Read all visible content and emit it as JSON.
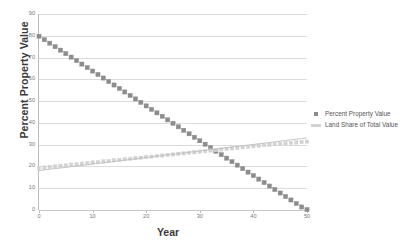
{
  "chart_data": {
    "type": "line",
    "title": "",
    "xlabel": "Year",
    "ylabel": "Percent Property Value",
    "xlim": [
      0,
      50
    ],
    "ylim": [
      0,
      90
    ],
    "xticks": [
      "0",
      "10",
      "20",
      "30",
      "40",
      "50"
    ],
    "yticks": [
      "0",
      "10",
      "20",
      "30",
      "40",
      "50",
      "60",
      "70",
      "80",
      "90"
    ],
    "grid": "horizontal",
    "legend_position": "right",
    "x": [
      0,
      1,
      2,
      3,
      4,
      5,
      6,
      7,
      8,
      9,
      10,
      11,
      12,
      13,
      14,
      15,
      16,
      17,
      18,
      19,
      20,
      21,
      22,
      23,
      24,
      25,
      26,
      27,
      28,
      29,
      30,
      31,
      32,
      33,
      34,
      35,
      36,
      37,
      38,
      39,
      40,
      41,
      42,
      43,
      44,
      45,
      46,
      47,
      48,
      49,
      50
    ],
    "series": [
      {
        "name": "Percent Property Value",
        "color": "#8c8c8c",
        "marker": "square",
        "values": [
          79.8,
          78.2,
          76.6,
          75.0,
          73.4,
          71.8,
          70.2,
          68.6,
          67.0,
          65.4,
          63.8,
          62.2,
          60.6,
          59.0,
          57.4,
          55.8,
          54.2,
          52.6,
          51.0,
          49.4,
          47.8,
          46.2,
          44.6,
          43.0,
          41.4,
          39.8,
          38.2,
          36.6,
          35.0,
          33.4,
          31.8,
          30.2,
          28.6,
          27.0,
          25.4,
          23.8,
          22.2,
          20.6,
          19.0,
          17.4,
          15.8,
          14.2,
          12.6,
          11.0,
          9.4,
          7.8,
          6.2,
          4.6,
          3.0,
          1.4,
          0.2
        ]
      },
      {
        "name": "Land Share of Total Value",
        "color": "#d2d2d2",
        "marker": "square-light",
        "values": [
          19.3,
          19.5,
          19.8,
          20.0,
          20.3,
          20.5,
          20.8,
          21.0,
          21.3,
          21.5,
          21.8,
          22.0,
          22.3,
          22.5,
          22.8,
          23.0,
          23.3,
          23.5,
          23.8,
          24.0,
          24.3,
          24.5,
          24.8,
          25.0,
          25.3,
          25.5,
          25.8,
          26.0,
          26.3,
          26.5,
          26.8,
          27.0,
          27.3,
          27.5,
          27.8,
          28.0,
          28.3,
          28.5,
          28.8,
          29.0,
          29.3,
          29.5,
          29.8,
          30.0,
          30.2,
          30.4,
          30.6,
          30.8,
          31.0,
          31.2,
          31.4
        ]
      },
      {
        "name": "Land Share trend line",
        "color": "#bfbfbf",
        "marker": "none",
        "values": [
          18.1,
          18.4,
          18.7,
          19.0,
          19.3,
          19.6,
          19.9,
          20.2,
          20.5,
          20.8,
          21.1,
          21.4,
          21.7,
          22.0,
          22.3,
          22.6,
          22.9,
          23.2,
          23.5,
          23.8,
          24.1,
          24.4,
          24.7,
          25.0,
          25.3,
          25.6,
          25.9,
          26.2,
          26.5,
          26.8,
          27.1,
          27.4,
          27.7,
          28.0,
          28.3,
          28.6,
          28.9,
          29.2,
          29.5,
          29.8,
          30.1,
          30.4,
          30.7,
          31.0,
          31.3,
          31.6,
          31.9,
          32.2,
          32.5,
          32.8,
          33.1
        ]
      }
    ],
    "legend": [
      {
        "label": "Percent Property Value",
        "marker": "square",
        "color": "#8c8c8c"
      },
      {
        "label": "Land Share of Total Value",
        "marker": "line",
        "color": "#d2d2d2"
      }
    ]
  }
}
